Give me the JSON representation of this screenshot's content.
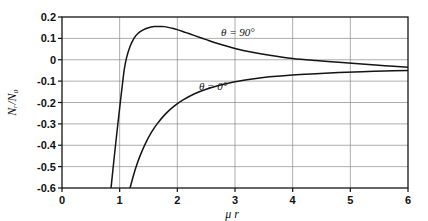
{
  "chart_data": {
    "type": "line",
    "title": "",
    "xlabel": "μ r",
    "ylabel": "Nᵣ/N₀",
    "xlim": [
      0,
      6
    ],
    "ylim": [
      -0.6,
      0.2
    ],
    "grid": true,
    "legend_position": "inline-annotation",
    "x_ticks": [
      "0",
      "1",
      "2",
      "3",
      "4",
      "5",
      "6"
    ],
    "x_tick_values": [
      0,
      1,
      2,
      3,
      4,
      5,
      6
    ],
    "y_ticks": [
      "0.2",
      "0.1",
      "0",
      "-0.1",
      "-0.2",
      "-0.3",
      "-0.4",
      "-0.5",
      "-0.6"
    ],
    "y_tick_values": [
      0.2,
      0.1,
      0,
      -0.1,
      -0.2,
      -0.3,
      -0.4,
      -0.5,
      -0.6
    ],
    "series": [
      {
        "name": "θ = 90°",
        "label": "θ = 90°",
        "label_x": 3.05,
        "label_y": 0.112,
        "x": [
          0.85,
          0.9,
          0.95,
          1.0,
          1.05,
          1.08,
          1.12,
          1.18,
          1.25,
          1.32,
          1.4,
          1.5,
          1.6,
          1.7,
          1.78,
          1.9,
          2.0,
          2.15,
          2.3,
          2.5,
          2.7,
          3.0,
          3.3,
          3.6,
          4.0,
          4.4,
          4.8,
          5.2,
          5.6,
          6.0
        ],
        "y": [
          -0.6,
          -0.47,
          -0.345,
          -0.225,
          -0.11,
          -0.045,
          0.01,
          0.062,
          0.101,
          0.124,
          0.139,
          0.15,
          0.155,
          0.156,
          0.155,
          0.148,
          0.141,
          0.127,
          0.113,
          0.094,
          0.076,
          0.053,
          0.035,
          0.021,
          0.006,
          -0.004,
          -0.012,
          -0.02,
          -0.028,
          -0.035
        ]
      },
      {
        "name": "θ = 0°",
        "label": "θ = 0°",
        "label_x": 2.62,
        "label_y": -0.142,
        "x": [
          1.18,
          1.22,
          1.28,
          1.35,
          1.45,
          1.55,
          1.65,
          1.8,
          1.95,
          2.1,
          2.3,
          2.5,
          2.7,
          3.0,
          3.3,
          3.6,
          4.0,
          4.4,
          4.8,
          5.2,
          5.6,
          6.0
        ],
        "y": [
          -0.6,
          -0.56,
          -0.505,
          -0.452,
          -0.39,
          -0.34,
          -0.3,
          -0.252,
          -0.216,
          -0.188,
          -0.159,
          -0.138,
          -0.122,
          -0.103,
          -0.09,
          -0.08,
          -0.071,
          -0.065,
          -0.06,
          -0.056,
          -0.053,
          -0.05
        ]
      }
    ]
  },
  "geometry": {
    "plot_left": 62,
    "plot_right": 408,
    "plot_top": 17,
    "plot_bottom": 188
  }
}
